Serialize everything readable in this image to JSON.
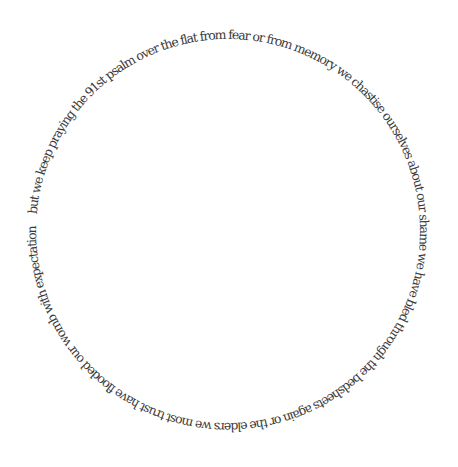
{
  "poem": {
    "text": "but we keep praying the 91st psalm over the flat from fear or from memory we chastise ourselves about our shame we have bled through the bedsheets again or the elders we most trust have flooded our womb with expectation",
    "layout": "circular",
    "text_color": "#3a3a3a",
    "background_color": "#ffffff"
  }
}
